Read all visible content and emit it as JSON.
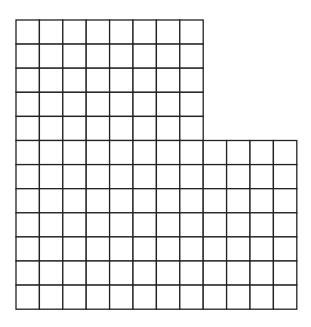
{
  "figure": {
    "line_color": "#222222",
    "background": "#ffffff",
    "origin_x": 16,
    "origin_y": 20,
    "cell_w": 23.4,
    "cell_h": 24.1,
    "line_width": 1.3,
    "sections": [
      {
        "name": "top-section",
        "rows": 5,
        "cols": 8,
        "start_row": 0
      },
      {
        "name": "bottom-section",
        "rows": 7,
        "cols": 12,
        "start_row": 5
      }
    ],
    "total_rows": 12,
    "total_cells": 124
  }
}
